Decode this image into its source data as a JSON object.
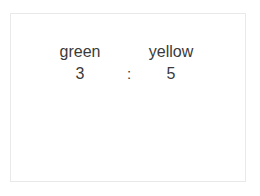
{
  "canvas": {
    "width": 260,
    "height": 196,
    "background_color": "#ffffff",
    "frame_border_color": "#e9e9e9"
  },
  "ratio": {
    "text_color": "#3a3a3a",
    "separator": ":",
    "left": {
      "label": "green",
      "value": "3"
    },
    "right": {
      "label": "yellow",
      "value": "5"
    }
  }
}
